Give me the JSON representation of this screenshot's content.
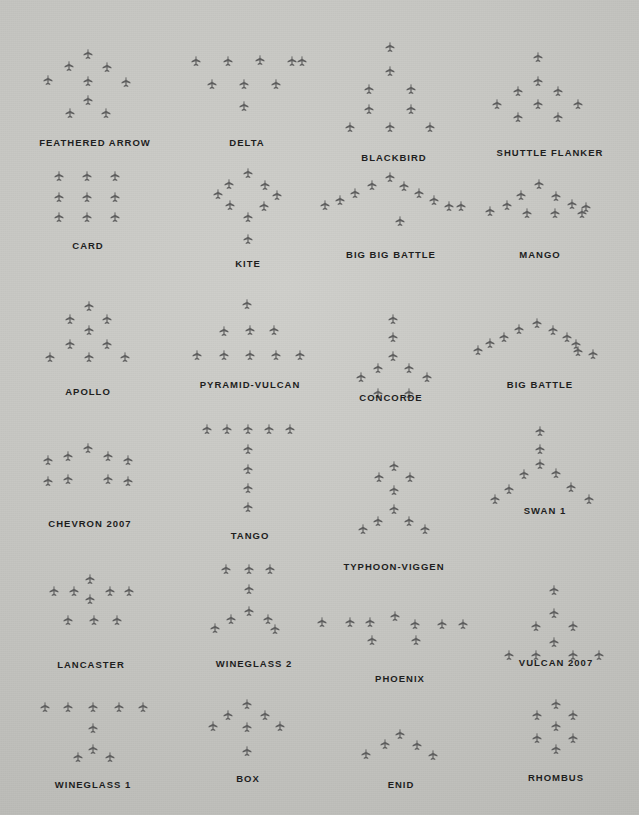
{
  "page": {
    "background_color": "#c6c6c2",
    "aircraft_color": "#5d5d5d",
    "label_color": "#1c1c1c",
    "plane_size": 13
  },
  "formations": [
    {
      "name": "FEATHERED ARROW",
      "label_x": 95,
      "label_y": 137,
      "count": 9,
      "planes": [
        [
          88,
          55
        ],
        [
          69,
          67
        ],
        [
          107,
          68
        ],
        [
          48,
          81
        ],
        [
          88,
          82
        ],
        [
          126,
          83
        ],
        [
          88,
          101
        ],
        [
          70,
          114
        ],
        [
          106,
          114
        ]
      ]
    },
    {
      "name": "DELTA",
      "label_x": 247,
      "label_y": 137,
      "count": 9,
      "planes": [
        [
          196,
          62
        ],
        [
          228,
          62
        ],
        [
          260,
          61
        ],
        [
          292,
          62
        ],
        [
          302,
          62
        ],
        [
          212,
          85
        ],
        [
          244,
          85
        ],
        [
          276,
          85
        ],
        [
          244,
          107
        ]
      ]
    },
    {
      "name": "BLACKBIRD",
      "label_x": 394,
      "label_y": 152,
      "count": 9,
      "planes": [
        [
          390,
          48
        ],
        [
          390,
          72
        ],
        [
          369,
          90
        ],
        [
          411,
          90
        ],
        [
          369,
          110
        ],
        [
          411,
          110
        ],
        [
          350,
          128
        ],
        [
          390,
          128
        ],
        [
          430,
          128
        ]
      ]
    },
    {
      "name": "SHUTTLE FLANKER",
      "label_x": 550,
      "label_y": 147,
      "count": 9,
      "planes": [
        [
          538,
          58
        ],
        [
          538,
          82
        ],
        [
          518,
          92
        ],
        [
          558,
          92
        ],
        [
          497,
          105
        ],
        [
          538,
          105
        ],
        [
          578,
          105
        ],
        [
          518,
          118
        ],
        [
          558,
          118
        ]
      ]
    },
    {
      "name": "CARD",
      "label_x": 88,
      "label_y": 240,
      "count": 9,
      "planes": [
        [
          59,
          177
        ],
        [
          87,
          177
        ],
        [
          115,
          177
        ],
        [
          59,
          198
        ],
        [
          87,
          198
        ],
        [
          115,
          198
        ],
        [
          59,
          218
        ],
        [
          87,
          218
        ],
        [
          115,
          218
        ]
      ]
    },
    {
      "name": "KITE",
      "label_x": 248,
      "label_y": 258,
      "count": 9,
      "planes": [
        [
          248,
          174
        ],
        [
          229,
          185
        ],
        [
          265,
          186
        ],
        [
          218,
          195
        ],
        [
          277,
          196
        ],
        [
          230,
          206
        ],
        [
          264,
          207
        ],
        [
          248,
          218
        ],
        [
          248,
          240
        ]
      ]
    },
    {
      "name": "BIG BIG BATTLE",
      "label_x": 391,
      "label_y": 249,
      "count": 11,
      "planes": [
        [
          390,
          178
        ],
        [
          372,
          186
        ],
        [
          355,
          194
        ],
        [
          340,
          201
        ],
        [
          325,
          206
        ],
        [
          404,
          187
        ],
        [
          419,
          194
        ],
        [
          434,
          201
        ],
        [
          449,
          207
        ],
        [
          461,
          207
        ],
        [
          400,
          222
        ]
      ]
    },
    {
      "name": "MANGO",
      "label_x": 540,
      "label_y": 249,
      "count": 10,
      "planes": [
        [
          539,
          185
        ],
        [
          521,
          196
        ],
        [
          556,
          197
        ],
        [
          507,
          206
        ],
        [
          572,
          205
        ],
        [
          586,
          208
        ],
        [
          490,
          212
        ],
        [
          527,
          214
        ],
        [
          555,
          214
        ],
        [
          582,
          214
        ]
      ]
    },
    {
      "name": "APOLLO",
      "label_x": 88,
      "label_y": 386,
      "count": 9,
      "planes": [
        [
          89,
          307
        ],
        [
          70,
          320
        ],
        [
          107,
          320
        ],
        [
          89,
          331
        ],
        [
          70,
          345
        ],
        [
          107,
          345
        ],
        [
          50,
          358
        ],
        [
          89,
          358
        ],
        [
          125,
          358
        ]
      ]
    },
    {
      "name": "PYRAMID-VULCAN",
      "label_x": 250,
      "label_y": 379,
      "count": 9,
      "planes": [
        [
          247,
          305
        ],
        [
          224,
          332
        ],
        [
          250,
          331
        ],
        [
          274,
          331
        ],
        [
          197,
          356
        ],
        [
          224,
          356
        ],
        [
          250,
          356
        ],
        [
          276,
          356
        ],
        [
          300,
          356
        ]
      ]
    },
    {
      "name": "CONCORDE",
      "label_x": 391,
      "label_y": 392,
      "count": 9,
      "planes": [
        [
          393,
          320
        ],
        [
          393,
          338
        ],
        [
          393,
          357
        ],
        [
          378,
          369
        ],
        [
          409,
          369
        ],
        [
          361,
          378
        ],
        [
          427,
          378
        ],
        [
          378,
          394
        ],
        [
          409,
          394
        ]
      ]
    },
    {
      "name": "BIG BATTLE",
      "label_x": 540,
      "label_y": 379,
      "count": 10,
      "planes": [
        [
          537,
          324
        ],
        [
          519,
          330
        ],
        [
          504,
          338
        ],
        [
          490,
          344
        ],
        [
          478,
          351
        ],
        [
          553,
          331
        ],
        [
          567,
          338
        ],
        [
          576,
          345
        ],
        [
          578,
          352
        ],
        [
          593,
          355
        ]
      ]
    },
    {
      "name": "CHEVRON 2007",
      "label_x": 90,
      "label_y": 518,
      "count": 9,
      "planes": [
        [
          88,
          449
        ],
        [
          68,
          457
        ],
        [
          108,
          457
        ],
        [
          48,
          461
        ],
        [
          128,
          461
        ],
        [
          68,
          480
        ],
        [
          108,
          480
        ],
        [
          48,
          482
        ],
        [
          128,
          482
        ]
      ]
    },
    {
      "name": "TANGO",
      "label_x": 250,
      "label_y": 530,
      "count": 9,
      "planes": [
        [
          207,
          430
        ],
        [
          227,
          430
        ],
        [
          248,
          430
        ],
        [
          269,
          430
        ],
        [
          290,
          430
        ],
        [
          248,
          450
        ],
        [
          248,
          470
        ],
        [
          248,
          489
        ],
        [
          248,
          508
        ]
      ]
    },
    {
      "name": "TYPHOON-VIGGEN",
      "label_x": 394,
      "label_y": 561,
      "count": 9,
      "planes": [
        [
          394,
          467
        ],
        [
          379,
          478
        ],
        [
          410,
          478
        ],
        [
          394,
          491
        ],
        [
          394,
          510
        ],
        [
          378,
          522
        ],
        [
          409,
          522
        ],
        [
          363,
          530
        ],
        [
          425,
          530
        ]
      ]
    },
    {
      "name": "SWAN 1",
      "label_x": 545,
      "label_y": 505,
      "count": 9,
      "planes": [
        [
          540,
          432
        ],
        [
          540,
          450
        ],
        [
          540,
          465
        ],
        [
          524,
          475
        ],
        [
          556,
          474
        ],
        [
          509,
          490
        ],
        [
          571,
          488
        ],
        [
          495,
          500
        ],
        [
          589,
          500
        ]
      ]
    },
    {
      "name": "LANCASTER",
      "label_x": 91,
      "label_y": 659,
      "count": 9,
      "planes": [
        [
          90,
          580
        ],
        [
          54,
          592
        ],
        [
          74,
          592
        ],
        [
          110,
          592
        ],
        [
          129,
          592
        ],
        [
          90,
          600
        ],
        [
          68,
          621
        ],
        [
          94,
          621
        ],
        [
          117,
          621
        ]
      ]
    },
    {
      "name": "WINEGLASS 2",
      "label_x": 254,
      "label_y": 658,
      "count": 9,
      "planes": [
        [
          226,
          570
        ],
        [
          249,
          570
        ],
        [
          270,
          570
        ],
        [
          249,
          590
        ],
        [
          249,
          612
        ],
        [
          231,
          620
        ],
        [
          268,
          620
        ],
        [
          215,
          629
        ],
        [
          275,
          630
        ]
      ]
    },
    {
      "name": "PHOENIX",
      "label_x": 400,
      "label_y": 673,
      "count": 9,
      "planes": [
        [
          395,
          617
        ],
        [
          322,
          623
        ],
        [
          350,
          623
        ],
        [
          370,
          623
        ],
        [
          415,
          625
        ],
        [
          442,
          625
        ],
        [
          463,
          625
        ],
        [
          372,
          641
        ],
        [
          416,
          641
        ]
      ]
    },
    {
      "name": "VULCAN 2007",
      "label_x": 556,
      "label_y": 657,
      "count": 9,
      "planes": [
        [
          554,
          591
        ],
        [
          554,
          614
        ],
        [
          536,
          627
        ],
        [
          573,
          627
        ],
        [
          554,
          643
        ],
        [
          509,
          656
        ],
        [
          536,
          656
        ],
        [
          573,
          656
        ],
        [
          599,
          656
        ]
      ]
    },
    {
      "name": "WINEGLASS 1",
      "label_x": 93,
      "label_y": 779,
      "count": 9,
      "planes": [
        [
          45,
          708
        ],
        [
          68,
          708
        ],
        [
          93,
          708
        ],
        [
          119,
          708
        ],
        [
          143,
          708
        ],
        [
          93,
          729
        ],
        [
          93,
          750
        ],
        [
          78,
          758
        ],
        [
          110,
          758
        ]
      ]
    },
    {
      "name": "BOX",
      "label_x": 248,
      "label_y": 773,
      "count": 9,
      "planes": [
        [
          247,
          705
        ],
        [
          228,
          716
        ],
        [
          265,
          716
        ],
        [
          213,
          727
        ],
        [
          247,
          728
        ],
        [
          280,
          727
        ],
        [
          247,
          752
        ]
      ]
    },
    {
      "name": "ENID",
      "label_x": 401,
      "label_y": 779,
      "count": 5,
      "planes": [
        [
          400,
          735
        ],
        [
          385,
          745
        ],
        [
          417,
          746
        ],
        [
          366,
          755
        ],
        [
          433,
          756
        ]
      ]
    },
    {
      "name": "RHOMBUS",
      "label_x": 556,
      "label_y": 772,
      "count": 7,
      "planes": [
        [
          556,
          705
        ],
        [
          537,
          716
        ],
        [
          573,
          716
        ],
        [
          556,
          727
        ],
        [
          537,
          739
        ],
        [
          573,
          739
        ],
        [
          556,
          750
        ]
      ]
    }
  ]
}
